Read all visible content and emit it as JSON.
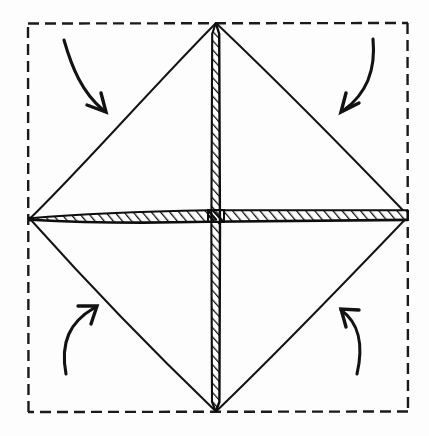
{
  "figure": {
    "title": "Origami folding diagram",
    "description": "Hand-drawn square sheet with dashed outline, inscribed diamond formed by folding the four corners to the center, hatched horizontal and vertical crease bands, and four curved arrows indicating the corners folding inward.",
    "background_color": "#fdfdfd",
    "ink_color": "#111111",
    "width": 429,
    "height": 436
  },
  "sheet_outline": {
    "name": "dashed-square-outline",
    "style": "dashed",
    "stroke_color": "#1a1a1a",
    "stroke_width": 2.4,
    "dash_length": 11,
    "dash_gap": 6,
    "left": 28,
    "top": 23,
    "right": 408,
    "bottom": 412
  },
  "diamond": {
    "name": "inscribed-diamond",
    "stroke_color": "#141414",
    "stroke_width": 2.0,
    "vertices": {
      "top": {
        "x": 216,
        "y": 22
      },
      "right": {
        "x": 408,
        "y": 216
      },
      "bottom": {
        "x": 216,
        "y": 412
      },
      "left": {
        "x": 30,
        "y": 218
      }
    },
    "edges": [
      {
        "label": "upper-left-edge",
        "from": "left",
        "to": "top"
      },
      {
        "label": "upper-right-edge",
        "from": "top",
        "to": "right"
      },
      {
        "label": "lower-right-edge",
        "from": "right",
        "to": "bottom"
      },
      {
        "label": "lower-left-edge",
        "from": "bottom",
        "to": "left"
      }
    ]
  },
  "crease_bands": [
    {
      "name": "horizontal-crease-band",
      "orientation": "horizontal",
      "hatched": true,
      "fill_color": "#ffffff",
      "stroke_color": "#101010",
      "hatch_color": "#101010",
      "hatch_angle_deg": 38,
      "from": {
        "x": 30,
        "y": 218
      },
      "to": {
        "x": 408,
        "y": 216
      },
      "thickness": 12
    },
    {
      "name": "vertical-crease-band",
      "orientation": "vertical",
      "hatched": true,
      "fill_color": "#ffffff",
      "stroke_color": "#101010",
      "hatch_color": "#101010",
      "hatch_angle_deg": 38,
      "from": {
        "x": 216,
        "y": 22
      },
      "to": {
        "x": 216,
        "y": 412
      },
      "thickness": 8
    }
  ],
  "arrows": [
    {
      "name": "fold-arrow-top-left",
      "direction": "down-right",
      "corner": "top-left",
      "stroke_color": "#121212",
      "stroke_width": 3.1,
      "start": {
        "x": 64,
        "y": 40
      },
      "control": {
        "x": 76,
        "y": 86
      },
      "end": {
        "x": 106,
        "y": 112
      },
      "head_angle_deg": 48
    },
    {
      "name": "fold-arrow-top-right",
      "direction": "down-left",
      "corner": "top-right",
      "stroke_color": "#121212",
      "stroke_width": 3.1,
      "start": {
        "x": 372,
        "y": 40
      },
      "control": {
        "x": 368,
        "y": 86
      },
      "end": {
        "x": 341,
        "y": 112
      },
      "head_angle_deg": 132
    },
    {
      "name": "fold-arrow-bottom-left",
      "direction": "up-right",
      "corner": "bottom-left",
      "stroke_color": "#121212",
      "stroke_width": 3.1,
      "start": {
        "x": 66,
        "y": 373
      },
      "control": {
        "x": 65,
        "y": 330
      },
      "end": {
        "x": 97,
        "y": 306
      },
      "head_angle_deg": -40
    },
    {
      "name": "fold-arrow-bottom-right",
      "direction": "up-left",
      "corner": "bottom-right",
      "stroke_color": "#121212",
      "stroke_width": 3.1,
      "start": {
        "x": 356,
        "y": 372
      },
      "control": {
        "x": 360,
        "y": 330
      },
      "end": {
        "x": 341,
        "y": 309
      },
      "head_angle_deg": -120
    }
  ]
}
